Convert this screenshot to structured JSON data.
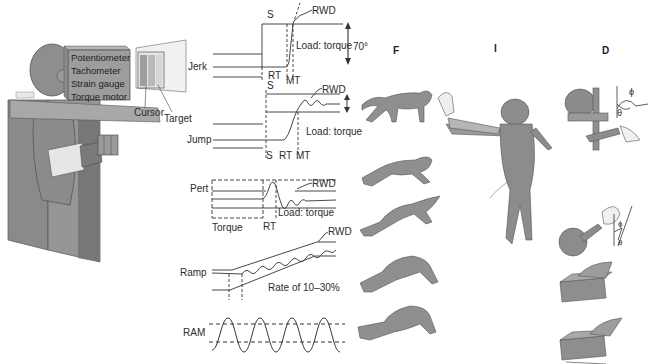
{
  "apparatus": {
    "box_labels": [
      "Potentiometer",
      "Tachometer",
      "Strain gauge",
      "Torque motor"
    ],
    "display_labels": {
      "cursor": "Cursor",
      "target": "Target"
    }
  },
  "traces": {
    "jerk": {
      "label": "Jerk",
      "markers": [
        "S",
        "RT",
        "MT"
      ],
      "reward": "RWD",
      "load": "Load: torque",
      "amplitude": "70°"
    },
    "jump": {
      "label": "Jump",
      "markers": [
        "S",
        "S",
        "RT",
        "MT"
      ],
      "reward": "RWD",
      "load": "Load: torque"
    },
    "pert": {
      "label": "Pert",
      "markers": [
        "RT"
      ],
      "reward": "RWD",
      "load": "Load: torque",
      "torque_label": "Torque"
    },
    "ramp": {
      "label": "Ramp",
      "reward": "RWD",
      "rate": "Rate of 10–30%"
    },
    "ram": {
      "label": "RAM"
    }
  },
  "panels": {
    "f": {
      "letter": "F"
    },
    "i": {
      "letter": "I"
    },
    "d": {
      "letter": "D",
      "angle_symbols": [
        "ϕ",
        "θ"
      ]
    }
  },
  "colors": {
    "gray_fill": "#8c8c8c",
    "dark_gray": "#5e5e5e",
    "line": "#333333",
    "light": "#c8c8c8"
  }
}
